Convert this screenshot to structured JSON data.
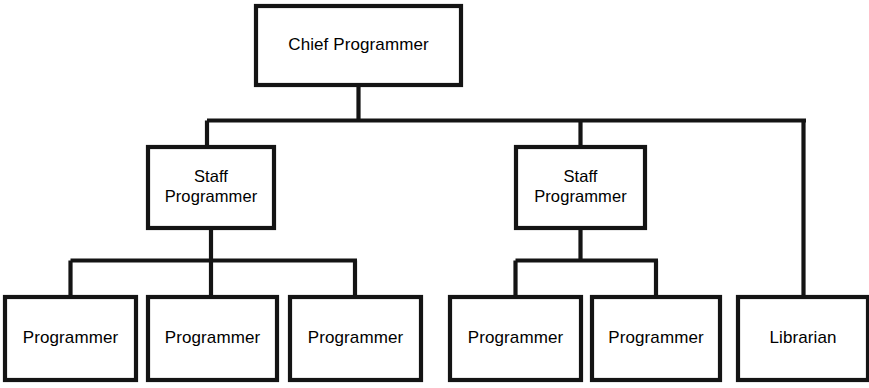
{
  "diagram": {
    "type": "organizational-hierarchy-tree",
    "background_color": "#ffffff",
    "line_color": "#141414",
    "text_color": "#000000",
    "box_fill_color": "#ffffff",
    "canvas": {
      "width": 869,
      "height": 388
    },
    "levels": 3
  },
  "nodes": {
    "root": {
      "label": "Chief Programmer",
      "lines": [
        "Chief Programmer"
      ],
      "x": 256,
      "y": 6,
      "w": 205,
      "h": 79
    },
    "staff_left": {
      "label": "Staff Programmer",
      "lines": [
        "Staff",
        "Programmer"
      ],
      "x": 148,
      "y": 147,
      "w": 126,
      "h": 81
    },
    "staff_right": {
      "label": "Staff Programmer",
      "lines": [
        "Staff",
        "Programmer"
      ],
      "x": 516,
      "y": 147,
      "w": 129,
      "h": 81
    },
    "leaf_1": {
      "label": "Programmer",
      "lines": [
        "Programmer"
      ],
      "x": 5,
      "y": 297,
      "w": 131,
      "h": 83
    },
    "leaf_2": {
      "label": "Programmer",
      "lines": [
        "Programmer"
      ],
      "x": 148,
      "y": 297,
      "w": 129,
      "h": 83
    },
    "leaf_3": {
      "label": "Programmer",
      "lines": [
        "Programmer"
      ],
      "x": 290,
      "y": 297,
      "w": 131,
      "h": 83
    },
    "leaf_4": {
      "label": "Programmer",
      "lines": [
        "Programmer"
      ],
      "x": 450,
      "y": 297,
      "w": 131,
      "h": 83
    },
    "leaf_5": {
      "label": "Programmer",
      "lines": [
        "Programmer"
      ],
      "x": 592,
      "y": 297,
      "w": 128,
      "h": 83
    },
    "leaf_6": {
      "label": "Librarian",
      "lines": [
        "Librarian"
      ],
      "x": 738,
      "y": 297,
      "w": 130,
      "h": 83
    }
  },
  "connectors": {
    "root_stem": "M 358.5 85 L 358.5 120.5",
    "top_bus": "M 207 120.5 L 806 120.5",
    "top_drop_left": "M 207 120.5 L 207 147",
    "top_drop_mid": "M 580.5 120.5 L 580.5 147",
    "top_drop_right": "M 803.5 120.5 L 803.5 297",
    "left_stem": "M 211 228 L 211 260.5",
    "left_bus": "M 70.5 260.5 L 357 260.5",
    "left_drop_1": "M 70.5 260.5 L 70.5 297",
    "left_drop_2": "M 211 260.5 L 211 297",
    "left_drop_3": "M 355 260.5 L 355 297",
    "right_stem": "M 580.5 228 L 580.5 260.5",
    "right_bus": "M 515.5 260.5 L 658 260.5",
    "right_drop_1": "M 515.5 260.5 L 515.5 297",
    "right_drop_2": "M 656 260.5 L 656 297"
  },
  "hierarchy": {
    "level_1": [
      "Chief Programmer"
    ],
    "level_2": [
      "Staff Programmer",
      "Staff Programmer"
    ],
    "level_3": [
      "Programmer",
      "Programmer",
      "Programmer",
      "Programmer",
      "Programmer",
      "Librarian"
    ],
    "edges": [
      {
        "from": "Chief Programmer",
        "to": "Staff Programmer (left)"
      },
      {
        "from": "Chief Programmer",
        "to": "Staff Programmer (right)"
      },
      {
        "from": "Chief Programmer",
        "to": "Librarian"
      },
      {
        "from": "Staff Programmer (left)",
        "to": "Programmer 1"
      },
      {
        "from": "Staff Programmer (left)",
        "to": "Programmer 2"
      },
      {
        "from": "Staff Programmer (left)",
        "to": "Programmer 3"
      },
      {
        "from": "Staff Programmer (right)",
        "to": "Programmer 4"
      },
      {
        "from": "Staff Programmer (right)",
        "to": "Programmer 5"
      }
    ]
  }
}
